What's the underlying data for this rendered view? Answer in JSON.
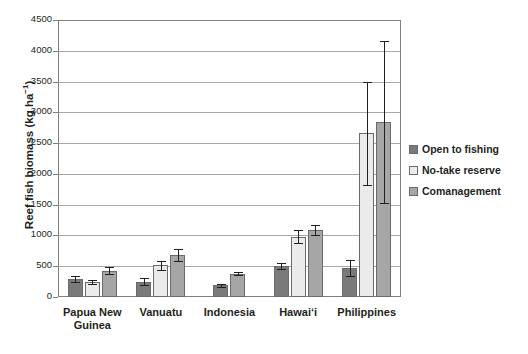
{
  "chart_data": {
    "type": "bar",
    "title": "",
    "subtitle": "",
    "xlabel": "",
    "ylabel": "Reef fish biomass (kg ha-1)",
    "ylabel_base": "Reef fish biomass (kg ha",
    "ylabel_sup": "−1",
    "ylabel_tail": ")",
    "ylim": [
      0,
      4500
    ],
    "ytick_step": 500,
    "yticks": [
      0,
      500,
      1000,
      1500,
      2000,
      2500,
      3000,
      3500,
      4000,
      4500
    ],
    "ytick_labels": [
      "0",
      "500",
      "1000",
      "1500",
      "2000",
      "2500",
      "3000",
      "3500",
      "4000",
      "4500"
    ],
    "grid": true,
    "grid_axis": "y",
    "legend_position": "right",
    "categories": [
      "Papua New Guinea",
      "Vanuatu",
      "Indonesia",
      "Hawaiʻi",
      "Philippines"
    ],
    "category_lines": [
      [
        "Papua New",
        "Guinea"
      ],
      [
        "Vanuatu"
      ],
      [
        "Indonesia"
      ],
      [
        "Hawaiʻi"
      ],
      [
        "Philippines"
      ]
    ],
    "series": [
      {
        "name": "Open to fishing",
        "color": "#7a7a7a",
        "values": [
          290,
          250,
          190,
          500,
          465
        ],
        "errors": [
          45,
          55,
          25,
          45,
          130
        ]
      },
      {
        "name": "No-take reserve",
        "color": "#ebebeb",
        "values": [
          240,
          515,
          null,
          980,
          2660
        ],
        "errors": [
          30,
          75,
          null,
          110,
          835
        ]
      },
      {
        "name": "Comanagement",
        "color": "#a6a6a6",
        "values": [
          430,
          680,
          380,
          1090,
          2840
        ],
        "errors": [
          60,
          95,
          20,
          80,
          1320
        ]
      }
    ]
  },
  "legend": {
    "items": [
      {
        "label": "Open to fishing",
        "color": "#7a7a7a"
      },
      {
        "label": "No-take reserve",
        "color": "#ebebeb"
      },
      {
        "label": "Comanagement",
        "color": "#a6a6a6"
      }
    ]
  }
}
